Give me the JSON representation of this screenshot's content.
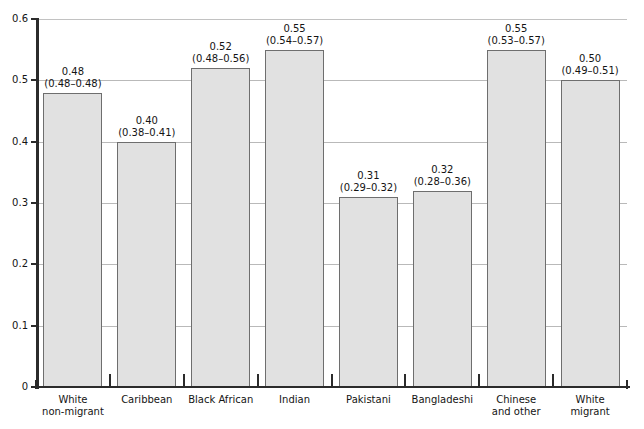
{
  "chart_data": {
    "type": "bar",
    "title": "",
    "xlabel": "",
    "ylabel": "",
    "ylim": [
      0,
      0.6
    ],
    "grid": true,
    "legend": "none",
    "y_ticks": [
      "0",
      "0.1",
      "0.2",
      "0.3",
      "0.4",
      "0.5",
      "0.6"
    ],
    "y_tick_values": [
      0,
      0.1,
      0.2,
      0.3,
      0.4,
      0.5,
      0.6
    ],
    "categories": [
      "White non-migrant",
      "Caribbean",
      "Black African",
      "Indian",
      "Pakistani",
      "Bangladeshi",
      "Chinese and other",
      "White migrant"
    ],
    "category_lines": [
      [
        "White",
        "non-migrant"
      ],
      [
        "Caribbean"
      ],
      [
        "Black African"
      ],
      [
        "Indian"
      ],
      [
        "Pakistani"
      ],
      [
        "Bangladeshi"
      ],
      [
        "Chinese",
        "and other"
      ],
      [
        "White",
        "migrant"
      ]
    ],
    "values": [
      0.48,
      0.4,
      0.52,
      0.55,
      0.31,
      0.32,
      0.55,
      0.5
    ],
    "value_labels": [
      "0.48",
      "0.40",
      "0.52",
      "0.55",
      "0.31",
      "0.32",
      "0.55",
      "0.50"
    ],
    "ci_labels": [
      "(0.48–0.48)",
      "(0.38–0.41)",
      "(0.48–0.56)",
      "(0.54–0.57)",
      "(0.29–0.32)",
      "(0.28–0.36)",
      "(0.53–0.57)",
      "(0.49–0.51)"
    ],
    "ci_low": [
      0.48,
      0.38,
      0.48,
      0.54,
      0.29,
      0.28,
      0.53,
      0.49
    ],
    "ci_high": [
      0.48,
      0.41,
      0.56,
      0.57,
      0.32,
      0.36,
      0.57,
      0.51
    ],
    "colors": {
      "bar_fill": "#e1e1e1",
      "bar_border": "#6e6e6e",
      "gridline": "#b9b9b9",
      "axis": "#2b2b2b",
      "text": "#141414",
      "background": "#ffffff"
    }
  }
}
